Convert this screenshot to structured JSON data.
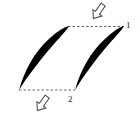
{
  "diagram": {
    "type": "blade-cascade",
    "labels": {
      "station_1": "1",
      "station_2": "2"
    },
    "elements": [
      {
        "name": "blade-left",
        "kind": "airfoil"
      },
      {
        "name": "blade-right",
        "kind": "airfoil"
      },
      {
        "name": "inlet-line",
        "kind": "dashed-line",
        "station": "1"
      },
      {
        "name": "outlet-line",
        "kind": "dashed-line",
        "station": "2"
      },
      {
        "name": "inlet-flow-arrow",
        "kind": "hollow-arrow",
        "direction": "down-left"
      },
      {
        "name": "outlet-flow-arrow",
        "kind": "hollow-arrow",
        "direction": "down-left"
      }
    ],
    "colors": {
      "blade": "#000000",
      "line": "#555555",
      "arrow": "#444444"
    }
  }
}
